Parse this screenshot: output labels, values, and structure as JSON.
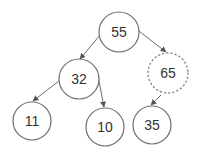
{
  "diagram": {
    "type": "binary-tree",
    "nodes": [
      {
        "id": "n55",
        "label": "55",
        "cx": 119,
        "cy": 32,
        "r": 20,
        "style": "solid"
      },
      {
        "id": "n32",
        "label": "32",
        "cx": 79,
        "cy": 79,
        "r": 20,
        "style": "solid"
      },
      {
        "id": "n65",
        "label": "65",
        "cx": 168,
        "cy": 73,
        "r": 20,
        "style": "dotted"
      },
      {
        "id": "n11",
        "label": "11",
        "cx": 32,
        "cy": 121,
        "r": 19,
        "style": "solid"
      },
      {
        "id": "n10",
        "label": "10",
        "cx": 105,
        "cy": 127,
        "r": 19,
        "style": "solid"
      },
      {
        "id": "n35",
        "label": "35",
        "cx": 152,
        "cy": 125,
        "r": 19,
        "style": "solid"
      }
    ],
    "edges": [
      {
        "from": "55",
        "to": "32",
        "x1": 100,
        "y1": 35,
        "x2": 80,
        "y2": 59
      },
      {
        "from": "55",
        "to": "65",
        "x1": 139,
        "y1": 31,
        "x2": 166,
        "y2": 52
      },
      {
        "from": "32",
        "to": "11",
        "x1": 59,
        "y1": 81,
        "x2": 33,
        "y2": 101
      },
      {
        "from": "32",
        "to": "10",
        "x1": 97,
        "y1": 71,
        "x2": 104,
        "y2": 107
      },
      {
        "from": "65",
        "to": "35",
        "x1": 161,
        "y1": 95,
        "x2": 151,
        "y2": 105
      }
    ],
    "colors": {
      "stroke": "#6e6e6e",
      "text": "#333333",
      "background": "#ffffff"
    }
  }
}
